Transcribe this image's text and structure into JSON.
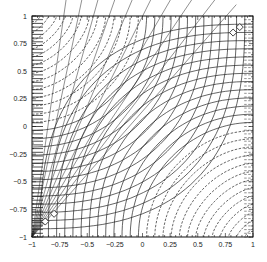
{
  "chart_data": {
    "type": "contour",
    "title": "",
    "xlabel": "",
    "ylabel": "",
    "xlim": [
      -1,
      1
    ],
    "ylim": [
      -1,
      1
    ],
    "x_ticks": [
      -1,
      -0.75,
      -0.5,
      -0.25,
      0,
      0.25,
      0.5,
      0.75,
      1
    ],
    "y_ticks": [
      -1,
      -0.75,
      -0.5,
      -0.25,
      0,
      0.25,
      0.5,
      0.75,
      1
    ],
    "x_tick_labels": [
      "-1",
      "-0.75",
      "-0.5",
      "-0.25",
      "0",
      "0.25",
      "0.5",
      "0.75",
      "1"
    ],
    "y_tick_labels": [
      "-1",
      "-0.75",
      "-0.5",
      "-0.25",
      "0",
      "0.25",
      "0.5",
      "0.75",
      "1"
    ],
    "grid": false,
    "legend": null,
    "solid_levels": 12,
    "dashed_levels": 14,
    "markers": [
      {
        "x": -0.8,
        "y": -0.79
      },
      {
        "x": -0.88,
        "y": -0.86
      },
      {
        "x": 0.82,
        "y": 0.85
      },
      {
        "x": 0.88,
        "y": 0.9
      }
    ],
    "line_color": "#222222"
  }
}
